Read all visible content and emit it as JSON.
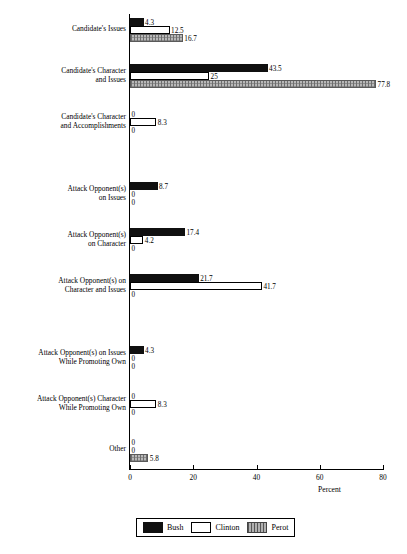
{
  "chart_data": {
    "type": "bar",
    "orientation": "horizontal",
    "title": "",
    "xlabel": "Percent",
    "ylabel": "",
    "xlim": [
      0,
      80
    ],
    "xticks": [
      0,
      20,
      40,
      60,
      80
    ],
    "grid": false,
    "legend_position": "bottom-center",
    "categories": [
      "Candidate's Issues",
      "Candidate's Character\nand Issues",
      "Candidate's Character\nand Accomplishments",
      "Attack Opponent(s)\non Issues",
      "Attack Opponent(s)\non Character",
      "Attack Opponent(s) on\nCharacter and Issues",
      "Attack Opponent(s) on Issues\nWhile Promoting Own",
      "Attack Opponent(s) Character\nWhile Promoting Own",
      "Other"
    ],
    "series": [
      {
        "name": "Bush",
        "color": "#101010",
        "values": [
          4.3,
          43.5,
          0,
          8.7,
          17.4,
          21.7,
          4.3,
          0,
          0
        ],
        "labels": [
          "4.3",
          "43.5",
          "0",
          "8.7",
          "17.4",
          "21.7",
          "4.3",
          "0",
          "0"
        ]
      },
      {
        "name": "Clinton",
        "color": "#ffffff",
        "values": [
          12.5,
          25,
          8.3,
          0,
          4.2,
          41.7,
          0,
          8.3,
          0
        ],
        "labels": [
          "12.5",
          "25",
          "8.3",
          "0",
          "4.2",
          "41.7",
          "0",
          "8.3",
          "0"
        ]
      },
      {
        "name": "Perot",
        "color": "#b8b8b8",
        "values": [
          16.7,
          77.8,
          0,
          0,
          0,
          0,
          0,
          0,
          5.8
        ],
        "labels": [
          "16.7",
          "77.8",
          "0",
          "0",
          "0",
          "0",
          "0",
          "0",
          "5.8"
        ]
      }
    ]
  },
  "axis": {
    "tick_labels": [
      "0",
      "20",
      "40",
      "60",
      "80"
    ],
    "title": "Percent"
  },
  "legend": {
    "items": [
      {
        "label": "Bush",
        "swatch": "black-square-icon"
      },
      {
        "label": "Clinton",
        "swatch": "white-square-icon"
      },
      {
        "label": "Perot",
        "swatch": "hatched-square-icon"
      }
    ]
  }
}
